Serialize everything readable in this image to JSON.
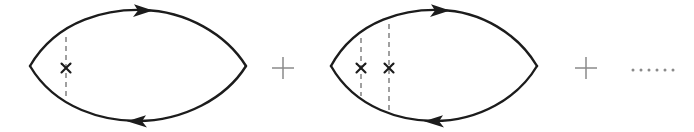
{
  "figure": {
    "name": "impurity-averaged-bubble-diagram-series",
    "canvas": {
      "width": 694,
      "height": 132,
      "background": "#ffffff"
    },
    "colors": {
      "propagator": "#1c1c1c",
      "impurity_dashed": "#6e6e6e",
      "cross": "#1c1c1c",
      "operator": "#8a8a8a"
    }
  },
  "terms": [
    {
      "id": "term-1",
      "kind": "bubble-diagram",
      "impurity_line_count": 1,
      "cross_count": 1,
      "lens": {
        "left_vertex_x": 30,
        "right_vertex_x": 246,
        "center_y": 66,
        "top_y": 9,
        "bottom_y": 123
      },
      "arrows": [
        {
          "name": "top-arrow",
          "direction": "right",
          "x": 143,
          "y": 11
        },
        {
          "name": "bottom-arrow",
          "direction": "left",
          "x": 137,
          "y": 121
        }
      ],
      "impurity_lines": [
        {
          "name": "impurity-line-1",
          "x": 66,
          "top_y": 37,
          "bottom_y": 97,
          "cross_y": 68
        }
      ]
    },
    {
      "id": "term-2",
      "kind": "bubble-diagram",
      "impurity_line_count": 2,
      "cross_count": 2,
      "lens": {
        "left_vertex_x": 331,
        "right_vertex_x": 537,
        "center_y": 66,
        "top_y": 9,
        "bottom_y": 123
      },
      "arrows": [
        {
          "name": "top-arrow",
          "direction": "right",
          "x": 440,
          "y": 11
        },
        {
          "name": "bottom-arrow",
          "direction": "left",
          "x": 434,
          "y": 121
        }
      ],
      "impurity_lines": [
        {
          "name": "impurity-line-1",
          "x": 361,
          "top_y": 38,
          "bottom_y": 96,
          "cross_y": 68
        },
        {
          "name": "impurity-line-2",
          "x": 389,
          "top_y": 24,
          "bottom_y": 110,
          "cross_y": 68
        }
      ]
    }
  ],
  "operators": [
    {
      "id": "plus-1",
      "symbol": "+",
      "x": 283,
      "y": 68,
      "size": 11
    },
    {
      "id": "plus-2",
      "symbol": "+",
      "x": 586,
      "y": 68,
      "size": 11
    }
  ],
  "ellipsis": {
    "id": "series-ellipsis",
    "symbol": "······",
    "dot_count": 6,
    "start_x": 633,
    "spacing": 8,
    "y": 70,
    "radius": 1.5
  }
}
